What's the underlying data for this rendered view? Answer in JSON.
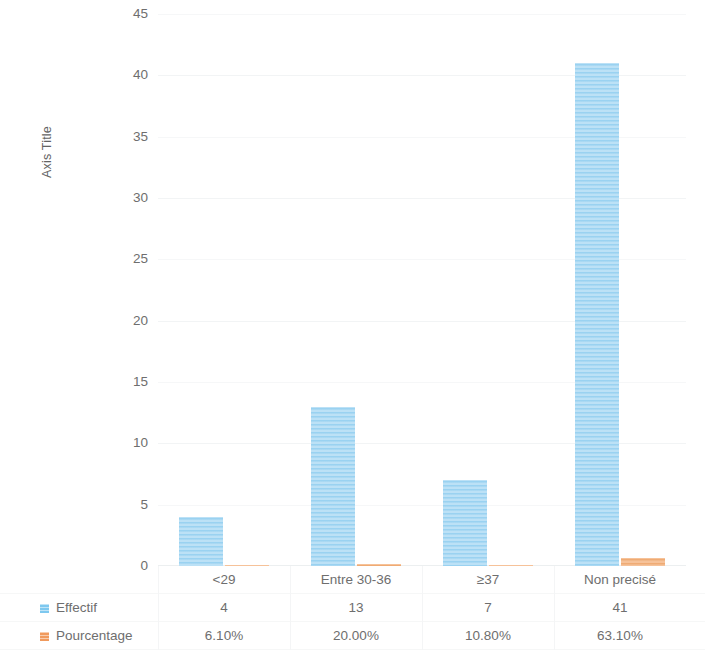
{
  "chart_data": {
    "type": "bar",
    "title": "",
    "xlabel": "",
    "ylabel": "Axis Title",
    "ylim": [
      0,
      45
    ],
    "ytick_step": 5,
    "yticks": [
      "45",
      "40",
      "35",
      "30",
      "25",
      "20",
      "15",
      "10",
      "5",
      "0"
    ],
    "grid": true,
    "legend_position": "bottom-left-table",
    "categories": [
      "<29",
      "Entre 30-36",
      "≥37",
      "Non precisé"
    ],
    "series": [
      {
        "name": "Effectif",
        "color": "#9bd3f2",
        "values": [
          4,
          13,
          7,
          41
        ],
        "display_values": [
          "4",
          "13",
          "7",
          "41"
        ]
      },
      {
        "name": "Pourcentage",
        "color": "#f3ab72",
        "values": [
          0.061,
          0.2,
          0.108,
          0.631
        ],
        "display_values": [
          "6.10%",
          "20.00%",
          "10.80%",
          "63.10%"
        ]
      }
    ]
  },
  "axis": {
    "y_title": "Axis Title",
    "ticks": [
      {
        "label": "45",
        "value": 45
      },
      {
        "label": "40",
        "value": 40
      },
      {
        "label": "35",
        "value": 35
      },
      {
        "label": "30",
        "value": 30
      },
      {
        "label": "25",
        "value": 25
      },
      {
        "label": "20",
        "value": 20
      },
      {
        "label": "15",
        "value": 15
      },
      {
        "label": "10",
        "value": 10
      },
      {
        "label": "5",
        "value": 5
      },
      {
        "label": "0",
        "value": 0
      }
    ]
  },
  "table": {
    "categories": [
      "<29",
      "Entre 30-36",
      "≥37",
      "Non precisé"
    ],
    "rows": [
      {
        "label": "Effectif",
        "swatch": "blue",
        "cells": [
          "4",
          "13",
          "7",
          "41"
        ]
      },
      {
        "label": "Pourcentage",
        "swatch": "orange",
        "cells": [
          "6.10%",
          "20.00%",
          "10.80%",
          "63.10%"
        ]
      }
    ]
  },
  "colors": {
    "effectif": "#9bd3f2",
    "pourcentage": "#f3ab72",
    "grid": "#f2f4f5",
    "text": "#6e6e6e"
  }
}
